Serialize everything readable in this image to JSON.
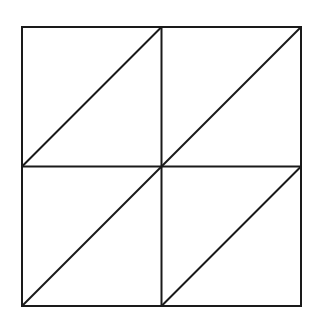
{
  "diagram": {
    "stroke_color": "#1a1a1a",
    "background_color": "#ffffff",
    "stroke_width": 2,
    "outer_square": {
      "x": 22,
      "y": 27,
      "size": 279
    },
    "grid": {
      "rows": 2,
      "cols": 2
    },
    "diagonal_direction": "bottom-left-to-top-right",
    "cells": [
      {
        "row": 0,
        "col": 0
      },
      {
        "row": 0,
        "col": 1
      },
      {
        "row": 1,
        "col": 0
      },
      {
        "row": 1,
        "col": 1
      }
    ]
  }
}
